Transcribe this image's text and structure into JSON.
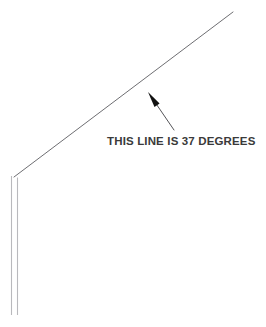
{
  "diagram": {
    "type": "technical-line-drawing",
    "background_color": "#ffffff",
    "annotation": {
      "label": "THIS LINE IS 37 DEGREES",
      "angle_degrees": 37,
      "text_color": "#3a3a3a",
      "text_position": {
        "x": 107,
        "y": 145
      }
    },
    "sloped_line": {
      "name": "sloped-line",
      "color": "#6e6e72",
      "width": 1,
      "start": {
        "x": 14,
        "y": 177
      },
      "end": {
        "x": 233,
        "y": 12
      }
    },
    "post": {
      "name": "vertical-post",
      "color": "#b9b9bd",
      "width": 1,
      "top_y": 176,
      "bottom_y": 315,
      "left_x": 11.5,
      "right_x": 17.5
    },
    "leader": {
      "name": "leader-line",
      "color": "#555559",
      "width": 1,
      "tail": {
        "x": 174,
        "y": 130
      },
      "tip": {
        "x": 148,
        "y": 92
      },
      "arrowhead_color": "#111111"
    }
  }
}
